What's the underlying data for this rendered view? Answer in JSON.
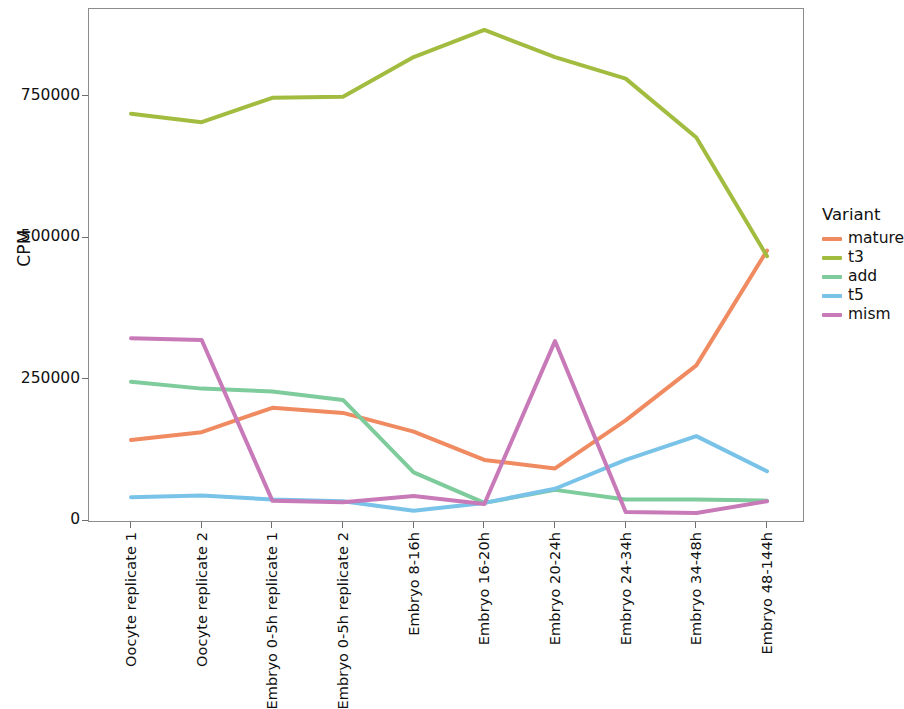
{
  "chart_data": {
    "type": "line",
    "title": "",
    "xlabel": "",
    "ylabel": "CPM",
    "legend_title": "Variant",
    "legend_position": "right",
    "grid": false,
    "ylim": [
      0,
      905000
    ],
    "yticks": [
      0,
      250000,
      500000,
      750000
    ],
    "ytick_labels": [
      "0",
      "250000",
      "500000",
      "750000"
    ],
    "categories": [
      "Oocyte replicate 1",
      "Oocyte replicate 2",
      "Embryo 0-5h replicate 1",
      "Embryo 0-5h replicate 2",
      "Embryo 8-16h",
      "Embryo 16-20h",
      "Embryo 20-24h",
      "Embryo 24-34h",
      "Embryo 34-48h",
      "Embryo 48-144h"
    ],
    "series": [
      {
        "name": "mature",
        "color": "#F08A60",
        "values": [
          143000,
          157000,
          200000,
          191000,
          158000,
          108000,
          93000,
          178000,
          275000,
          478000
        ]
      },
      {
        "name": "t3",
        "color": "#A2BC3F",
        "values": [
          720000,
          705000,
          748000,
          750000,
          820000,
          868000,
          820000,
          782000,
          678000,
          468000
        ]
      },
      {
        "name": "add",
        "color": "#7ECB9C",
        "values": [
          246000,
          234000,
          229000,
          214000,
          86000,
          32000,
          55000,
          38000,
          38000,
          36000
        ]
      },
      {
        "name": "t5",
        "color": "#79C3E8",
        "values": [
          42000,
          45000,
          38000,
          35000,
          18000,
          32000,
          57000,
          108000,
          150000,
          88000
        ]
      },
      {
        "name": "mism",
        "color": "#C879B8",
        "values": [
          323000,
          320000,
          36000,
          33000,
          44000,
          30000,
          318000,
          16000,
          14000,
          35000
        ]
      }
    ]
  }
}
